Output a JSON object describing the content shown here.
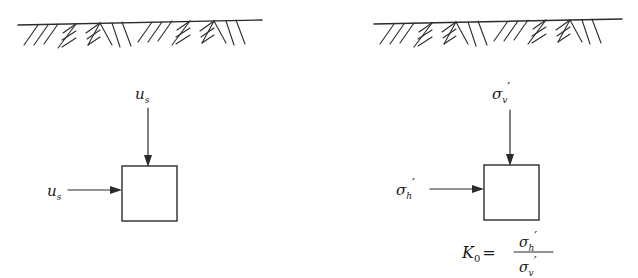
{
  "figure": {
    "background_color": "#ffffff",
    "line_color": "#2b2b2b",
    "panels": [
      {
        "id": "left-panel",
        "name": "total-pore-pressure-panel",
        "ground_label": "ground-surface-hatching",
        "vertical_load": {
          "symbol": "u",
          "subscript": "s",
          "prime": "",
          "full": "u_s"
        },
        "horizontal_load": {
          "symbol": "u",
          "subscript": "s",
          "prime": "",
          "full": "u_s"
        },
        "element_label": "soil-element-square"
      },
      {
        "id": "right-panel",
        "name": "effective-stress-panel",
        "ground_label": "ground-surface-hatching",
        "vertical_load": {
          "symbol": "σ",
          "subscript": "v",
          "prime": "′",
          "full": "σ_v′"
        },
        "horizontal_load": {
          "symbol": "σ",
          "subscript": "h",
          "prime": "′",
          "full": "σ_h′"
        },
        "element_label": "soil-element-square",
        "equation": {
          "lhs_symbol": "K",
          "lhs_subscript": "0",
          "equals": "=",
          "numerator_symbol": "σ",
          "numerator_subscript": "h",
          "numerator_prime": "′",
          "denominator_symbol": "σ",
          "denominator_subscript": "v",
          "denominator_prime": "′",
          "full": "K0 = σh′ / σv′"
        }
      }
    ]
  }
}
